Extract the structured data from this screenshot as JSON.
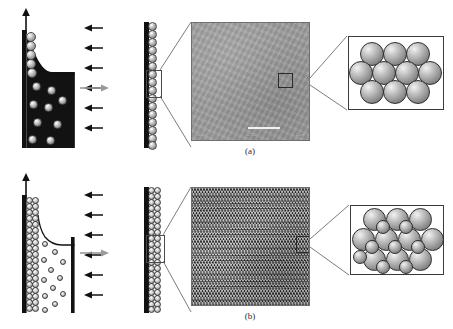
{
  "figure": {
    "caption_a": "(a)",
    "caption_b": "(b)",
    "panels": [
      {
        "id": "a",
        "label": "(a)",
        "schematic": {
          "withdrawal_arrow": "up-arrow",
          "substrate_label": "substrate",
          "suspension_label": "colloidal-suspension",
          "meniscus_label": "meniscus",
          "evaporation_arrows": 6,
          "evaporation_direction": "left",
          "bead_size": "large",
          "beads_in_ordered_region": 5,
          "beads_in_suspension": 9
        },
        "transition_arrow": "arrow-right",
        "film": {
          "layers": 1,
          "bead_count": 16,
          "highlight_box": "region-of-interest"
        },
        "sem": {
          "type": "sem-micrograph",
          "status_left": "15.0kV",
          "status_mid": "x2,500",
          "status_right": "10µm",
          "scalebar": "10 µm",
          "roi_box": "magnified-region"
        },
        "inset": {
          "title": "hexagonal-close-packed-monolayer",
          "rows": [
            3,
            4,
            3
          ],
          "sphere_size": "large",
          "sphere_count": 10
        }
      },
      {
        "id": "b",
        "label": "(b)",
        "schematic": {
          "withdrawal_arrow": "up-arrow",
          "substrate_label": "substrate",
          "suspension_label": "colloidal-suspension",
          "meniscus_label": "meniscus",
          "evaporation_arrows": 6,
          "evaporation_direction": "left",
          "bead_size": "small",
          "beads_in_ordered_region": 18,
          "beads_in_suspension": 12
        },
        "transition_arrow": "arrow-right",
        "film": {
          "layers": 2,
          "bead_count": 34,
          "highlight_box": "region-of-interest"
        },
        "sem": {
          "type": "sem-micrograph",
          "status_left": "15.0kV",
          "status_mid": "x10,000",
          "status_right": "1µm",
          "scalebar": "1 µm",
          "roi_box": "magnified-region"
        },
        "inset": {
          "title": "close-packed-multilayer",
          "rows": [
            3,
            4,
            3
          ],
          "interstitial_rows": [
            4,
            4
          ],
          "sphere_size": "large",
          "sphere_count": 10,
          "interstitial_count": 8
        }
      }
    ],
    "colors": {
      "substrate": "#111111",
      "suspension": "#121212",
      "bead_fill": "#9b9b9b",
      "bead_outline": "#4a4a4a",
      "transition_arrow": "#9a9a9a",
      "sem_background": "#9a9a9a",
      "inset_border": "#3b3b3b",
      "leader_line": "#5a5a5a"
    }
  }
}
